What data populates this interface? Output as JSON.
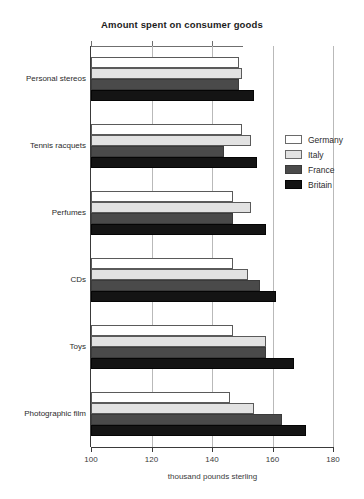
{
  "chart_data": {
    "type": "bar",
    "orientation": "horizontal",
    "title": "Amount spent on consumer goods",
    "xlabel": "thousand pounds sterling",
    "ylabel": "",
    "xlim": [
      100,
      180
    ],
    "xticks": [
      100,
      120,
      140,
      160,
      180
    ],
    "xtick_labels": [
      "100",
      "120",
      "140",
      "160",
      "180"
    ],
    "grid": "vertical",
    "legend_position": "right",
    "categories": [
      "Personal stereos",
      "Tennis racquets",
      "Perfumes",
      "CDs",
      "Toys",
      "Photographic film"
    ],
    "series": [
      {
        "name": "Germany",
        "color": "#ffffff",
        "values": [
          149,
          150,
          147,
          147,
          147,
          146
        ]
      },
      {
        "name": "Italy",
        "color": "#e2e2e2",
        "values": [
          150,
          153,
          153,
          152,
          158,
          154
        ]
      },
      {
        "name": "France",
        "color": "#4a4a4a",
        "values": [
          149,
          144,
          147,
          156,
          158,
          163
        ]
      },
      {
        "name": "Britain",
        "color": "#141414",
        "values": [
          154,
          155,
          158,
          161,
          167,
          171
        ]
      }
    ]
  },
  "legend": {
    "entries": [
      {
        "label": "Germany",
        "key": "germany"
      },
      {
        "label": "Italy",
        "key": "italy"
      },
      {
        "label": "France",
        "key": "france"
      },
      {
        "label": "Britain",
        "key": "britain"
      }
    ]
  }
}
